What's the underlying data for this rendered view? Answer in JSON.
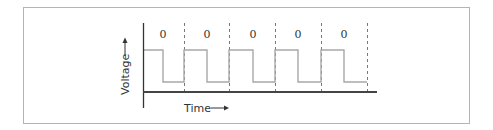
{
  "diagram": {
    "title": "",
    "y_axis_label": "Voltage",
    "x_axis_label": "Time",
    "bit_labels": [
      "0",
      "0",
      "0",
      "0",
      "0"
    ],
    "colors": {
      "frame": "#b4b4b4",
      "axis": "#333333",
      "signal": "#a8a8a8",
      "divider": "#555555",
      "text": "#333333"
    }
  }
}
